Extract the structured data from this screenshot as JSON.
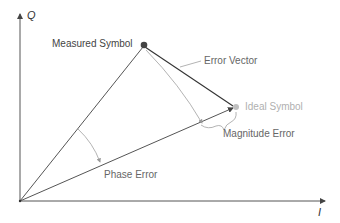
{
  "diagram": {
    "type": "IQ constellation error vector diagram",
    "axes": {
      "x_label": "I",
      "y_label": "Q"
    },
    "labels": {
      "measured_symbol": "Measured Symbol",
      "ideal_symbol": "Ideal Symbol",
      "error_vector": "Error Vector",
      "magnitude_error": "Magnitude Error",
      "phase_error": "Phase Error"
    },
    "colors": {
      "axis": "#555555",
      "vector_line": "#444444",
      "error_vector": "#333333",
      "arc": "#aaaaaa",
      "measured_dot": "#444444",
      "ideal_dot": "#bbbbbb",
      "measured_text": "#444444",
      "ideal_text": "#b8b8b8",
      "annotation_text": "#666666"
    }
  }
}
